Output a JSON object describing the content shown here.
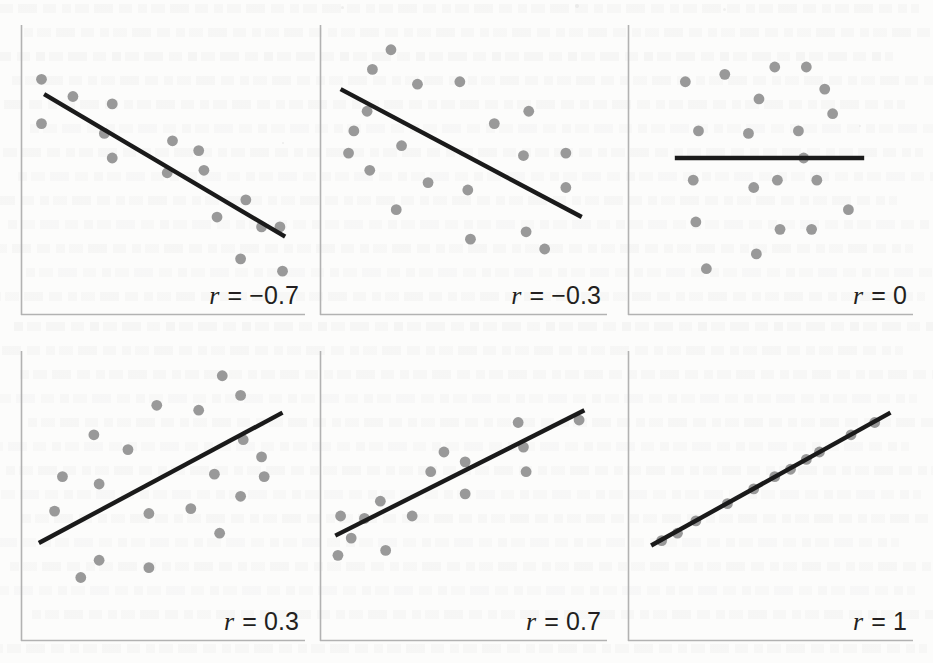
{
  "figure": {
    "kind": "scatterplot-matrix",
    "panel_count": 6,
    "rows": 2,
    "cols": 3,
    "dot_color": "#999999",
    "line_color": "#1a1a1a",
    "axis_color": "#b2b2b2",
    "background_color": "#fcfcfb"
  },
  "chart_data": [
    {
      "type": "scatter",
      "title": "r = −0.7",
      "label_symbol": "r",
      "label_equals": "= −0.7",
      "r": -0.7,
      "xlabel": "",
      "ylabel": "",
      "xlim": [
        0,
        100
      ],
      "ylim": [
        0,
        100
      ],
      "grid": false,
      "legend": "none",
      "trendline": {
        "x0": 5,
        "y0": 76,
        "x1": 97,
        "y1": 18
      },
      "points": [
        {
          "x": 4,
          "y": 82
        },
        {
          "x": 4,
          "y": 64
        },
        {
          "x": 16,
          "y": 75
        },
        {
          "x": 31,
          "y": 72
        },
        {
          "x": 28,
          "y": 60
        },
        {
          "x": 31,
          "y": 50
        },
        {
          "x": 54,
          "y": 57
        },
        {
          "x": 52,
          "y": 44
        },
        {
          "x": 64,
          "y": 53
        },
        {
          "x": 66,
          "y": 45
        },
        {
          "x": 71,
          "y": 26
        },
        {
          "x": 82,
          "y": 33
        },
        {
          "x": 88,
          "y": 22
        },
        {
          "x": 95,
          "y": 22
        },
        {
          "x": 80,
          "y": 9
        },
        {
          "x": 96,
          "y": 4
        }
      ]
    },
    {
      "type": "scatter",
      "title": "r = −0.3",
      "label_symbol": "r",
      "label_equals": "= −0.3",
      "r": -0.3,
      "xlabel": "",
      "ylabel": "",
      "xlim": [
        0,
        100
      ],
      "ylim": [
        0,
        100
      ],
      "grid": false,
      "legend": "none",
      "trendline": {
        "x0": 4,
        "y0": 78,
        "x1": 95,
        "y1": 26
      },
      "points": [
        {
          "x": 23,
          "y": 94
        },
        {
          "x": 16,
          "y": 86
        },
        {
          "x": 33,
          "y": 80
        },
        {
          "x": 49,
          "y": 81
        },
        {
          "x": 14,
          "y": 69
        },
        {
          "x": 75,
          "y": 69
        },
        {
          "x": 9,
          "y": 61
        },
        {
          "x": 62,
          "y": 64
        },
        {
          "x": 27,
          "y": 55
        },
        {
          "x": 7,
          "y": 52
        },
        {
          "x": 73,
          "y": 51
        },
        {
          "x": 89,
          "y": 52
        },
        {
          "x": 15,
          "y": 45
        },
        {
          "x": 37,
          "y": 40
        },
        {
          "x": 52,
          "y": 37
        },
        {
          "x": 89,
          "y": 38
        },
        {
          "x": 25,
          "y": 29
        },
        {
          "x": 74,
          "y": 20
        },
        {
          "x": 53,
          "y": 17
        },
        {
          "x": 81,
          "y": 13
        }
      ]
    },
    {
      "type": "scatter",
      "title": "r = 0",
      "label_symbol": "r",
      "label_equals": "= 0",
      "r": 0,
      "xlabel": "",
      "ylabel": "",
      "xlim": [
        0,
        100
      ],
      "ylim": [
        0,
        100
      ],
      "grid": false,
      "legend": "none",
      "trendline": {
        "x0": 14,
        "y0": 50,
        "x1": 86,
        "y1": 50
      },
      "points": [
        {
          "x": 52,
          "y": 87
        },
        {
          "x": 64,
          "y": 87
        },
        {
          "x": 33,
          "y": 84
        },
        {
          "x": 18,
          "y": 81
        },
        {
          "x": 71,
          "y": 78
        },
        {
          "x": 46,
          "y": 74
        },
        {
          "x": 74,
          "y": 68
        },
        {
          "x": 23,
          "y": 61
        },
        {
          "x": 42,
          "y": 60
        },
        {
          "x": 61,
          "y": 61
        },
        {
          "x": 63,
          "y": 50
        },
        {
          "x": 21,
          "y": 41
        },
        {
          "x": 53,
          "y": 41
        },
        {
          "x": 68,
          "y": 41
        },
        {
          "x": 44,
          "y": 38
        },
        {
          "x": 80,
          "y": 29
        },
        {
          "x": 22,
          "y": 24
        },
        {
          "x": 54,
          "y": 21
        },
        {
          "x": 66,
          "y": 21
        },
        {
          "x": 45,
          "y": 11
        },
        {
          "x": 26,
          "y": 5
        }
      ]
    },
    {
      "type": "scatter",
      "title": "r = 0.3",
      "label_symbol": "r",
      "label_equals": "= 0.3",
      "r": 0.3,
      "xlabel": "",
      "ylabel": "",
      "xlim": [
        0,
        100
      ],
      "ylim": [
        0,
        100
      ],
      "grid": false,
      "legend": "none",
      "trendline": {
        "x0": 3,
        "y0": 26,
        "x1": 96,
        "y1": 79
      },
      "points": [
        {
          "x": 73,
          "y": 94
        },
        {
          "x": 80,
          "y": 86
        },
        {
          "x": 48,
          "y": 82
        },
        {
          "x": 64,
          "y": 80
        },
        {
          "x": 24,
          "y": 70
        },
        {
          "x": 81,
          "y": 68
        },
        {
          "x": 37,
          "y": 64
        },
        {
          "x": 88,
          "y": 61
        },
        {
          "x": 12,
          "y": 53
        },
        {
          "x": 26,
          "y": 50
        },
        {
          "x": 70,
          "y": 54
        },
        {
          "x": 89,
          "y": 53
        },
        {
          "x": 80,
          "y": 45
        },
        {
          "x": 9,
          "y": 39
        },
        {
          "x": 45,
          "y": 38
        },
        {
          "x": 61,
          "y": 40
        },
        {
          "x": 72,
          "y": 30
        },
        {
          "x": 26,
          "y": 19
        },
        {
          "x": 45,
          "y": 16
        },
        {
          "x": 19,
          "y": 12
        }
      ]
    },
    {
      "type": "scatter",
      "title": "r = 0.7",
      "label_symbol": "r",
      "label_equals": "= 0.7",
      "r": 0.7,
      "xlabel": "",
      "ylabel": "",
      "xlim": [
        0,
        100
      ],
      "ylim": [
        0,
        100
      ],
      "grid": false,
      "legend": "none",
      "trendline": {
        "x0": 2,
        "y0": 29,
        "x1": 96,
        "y1": 80
      },
      "points": [
        {
          "x": 94,
          "y": 76
        },
        {
          "x": 71,
          "y": 75
        },
        {
          "x": 73,
          "y": 65
        },
        {
          "x": 43,
          "y": 63
        },
        {
          "x": 51,
          "y": 59
        },
        {
          "x": 38,
          "y": 55
        },
        {
          "x": 74,
          "y": 55
        },
        {
          "x": 51,
          "y": 46
        },
        {
          "x": 19,
          "y": 43
        },
        {
          "x": 4,
          "y": 37
        },
        {
          "x": 13,
          "y": 36
        },
        {
          "x": 31,
          "y": 37
        },
        {
          "x": 8,
          "y": 28
        },
        {
          "x": 21,
          "y": 23
        },
        {
          "x": 3,
          "y": 21
        }
      ]
    },
    {
      "type": "scatter",
      "title": "r = 1",
      "label_symbol": "r",
      "label_equals": "= 1",
      "r": 1,
      "xlabel": "",
      "ylabel": "",
      "xlim": [
        0,
        100
      ],
      "ylim": [
        0,
        100
      ],
      "grid": false,
      "legend": "none",
      "trendline": {
        "x0": 5,
        "y0": 25,
        "x1": 96,
        "y1": 79
      },
      "points": [
        {
          "x": 9,
          "y": 27
        },
        {
          "x": 15,
          "y": 30
        },
        {
          "x": 22,
          "y": 35
        },
        {
          "x": 34,
          "y": 42
        },
        {
          "x": 44,
          "y": 48
        },
        {
          "x": 52,
          "y": 53
        },
        {
          "x": 58,
          "y": 56
        },
        {
          "x": 64,
          "y": 60
        },
        {
          "x": 69,
          "y": 63
        },
        {
          "x": 81,
          "y": 70
        },
        {
          "x": 90,
          "y": 75
        }
      ]
    }
  ]
}
